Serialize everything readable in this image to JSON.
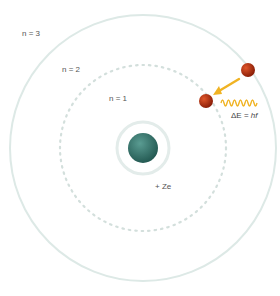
{
  "diagram": {
    "orbits": [
      {
        "label": "n = 1",
        "radius": 30,
        "style": "solid"
      },
      {
        "label": "n = 2",
        "radius": 83,
        "style": "dotted"
      },
      {
        "label": "n = 3",
        "radius": 133,
        "style": "solid"
      }
    ],
    "nucleus": {
      "label": "+ Ze",
      "color": "#3a7d74"
    },
    "electron": {
      "color": "#b8320f"
    },
    "arrow": {
      "color": "#f0b323"
    },
    "photon": {
      "color": "#f0b323",
      "equation_prefix": "ΔE = ",
      "equation_var": "hf"
    },
    "colors": {
      "orbit": "#dde9e6",
      "orbit_dot": "#cfdcd9"
    }
  }
}
